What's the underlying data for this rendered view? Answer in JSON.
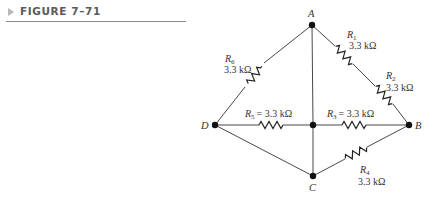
{
  "figure": {
    "title": "FIGURE 7–71",
    "marker_icon": "triangle-right-icon"
  },
  "nodes": {
    "A": {
      "label": "A",
      "x": 312,
      "y": 25
    },
    "B": {
      "label": "B",
      "x": 409,
      "y": 125
    },
    "C": {
      "label": "C",
      "x": 313,
      "y": 176
    },
    "D": {
      "label": "D",
      "x": 215,
      "y": 125
    },
    "center": {
      "label": "",
      "x": 313,
      "y": 125
    }
  },
  "resistors": [
    {
      "id": "R1",
      "name": "R",
      "sub": "1",
      "value": "3.3 kΩ",
      "between": [
        "A",
        "B"
      ]
    },
    {
      "id": "R2",
      "name": "R",
      "sub": "2",
      "value": "3.3 kΩ",
      "between": [
        "A",
        "B"
      ]
    },
    {
      "id": "R3",
      "name": "R",
      "sub": "3",
      "value": "= 3.3 kΩ",
      "between": [
        "center",
        "B"
      ]
    },
    {
      "id": "R4",
      "name": "R",
      "sub": "4",
      "value": "3.3 kΩ",
      "between": [
        "C",
        "B"
      ]
    },
    {
      "id": "R5",
      "name": "R",
      "sub": "5",
      "value": "= 3.3 kΩ",
      "between": [
        "D",
        "center"
      ]
    },
    {
      "id": "R6",
      "name": "R",
      "sub": "6",
      "value": "3.3 kΩ",
      "between": [
        "D",
        "A"
      ]
    }
  ],
  "colors": {
    "wire": "#333333",
    "header_text": "#5a5a5a",
    "header_rule": "#8a8a8a"
  }
}
